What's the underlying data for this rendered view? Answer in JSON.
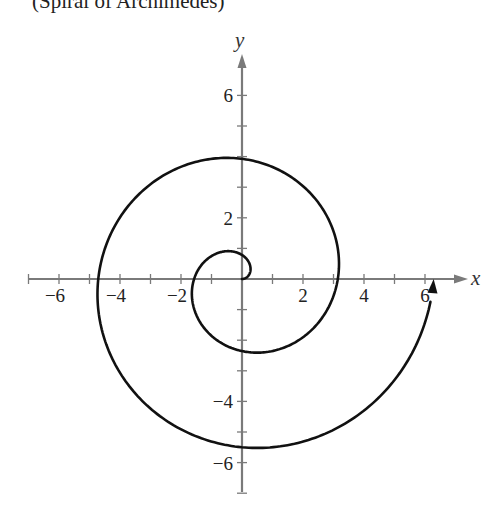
{
  "title": "(Spiral of Archimedes)",
  "chart_data": {
    "type": "line",
    "title": "(Spiral of Archimedes)",
    "equation": "r = θ/2, 0 ≤ θ ≤ 4π",
    "xlabel": "x",
    "ylabel": "y",
    "xlim": [
      -7,
      7
    ],
    "ylim": [
      -7,
      7
    ],
    "grid": false,
    "legend": null,
    "x_ticks": [
      -7,
      -6,
      -5,
      -4,
      -3,
      -2,
      -1,
      1,
      2,
      3,
      4,
      5,
      6
    ],
    "x_tick_labels": [
      "−6",
      "−4",
      "−2",
      "2",
      "4",
      "6"
    ],
    "x_tick_label_values": [
      -6,
      -4,
      -2,
      2,
      4,
      6
    ],
    "y_ticks": [
      -7,
      -6,
      -5,
      -4,
      -3,
      -2,
      -1,
      1,
      2,
      3,
      4,
      5,
      6
    ],
    "y_tick_labels": [
      "6",
      "2",
      "−4",
      "−6"
    ],
    "y_tick_label_values": [
      6,
      2,
      -4,
      -6
    ],
    "series": [
      {
        "name": "spiral",
        "theta_start": 0,
        "theta_end": 12.566,
        "r_coefficient": 0.5,
        "key_points": [
          {
            "theta": 0,
            "x": 0,
            "y": 0
          },
          {
            "theta": 1.571,
            "x": 0,
            "y": 0.79
          },
          {
            "theta": 3.142,
            "x": -1.57,
            "y": 0
          },
          {
            "theta": 4.712,
            "x": 0,
            "y": -2.36
          },
          {
            "theta": 6.283,
            "x": 3.14,
            "y": 0
          },
          {
            "theta": 7.854,
            "x": 0,
            "y": 3.93
          },
          {
            "theta": 9.425,
            "x": -4.71,
            "y": 0
          },
          {
            "theta": 10.996,
            "x": 0,
            "y": -5.5
          },
          {
            "theta": 12.566,
            "x": 6.28,
            "y": 0
          }
        ],
        "end_arrow": true,
        "color": "#111111"
      }
    ]
  },
  "colors": {
    "axis": "#7a7a7a",
    "curve": "#111111",
    "text": "#222222"
  }
}
